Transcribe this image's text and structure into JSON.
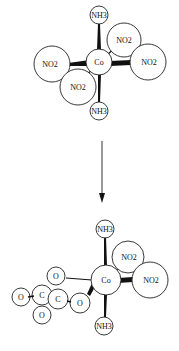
{
  "diagram": {
    "type": "reaction-scheme",
    "reactant": {
      "center": "Co",
      "ligands": {
        "axial_top": "NH3",
        "axial_bottom": "NH3",
        "no2_upper_right": "NO2",
        "no2_right": "NO2",
        "no2_left": "NO2",
        "no2_lower_left": "NO2"
      }
    },
    "arrow": {
      "direction": "down"
    },
    "product": {
      "center": "Co",
      "ligands": {
        "axial_top": "NH3",
        "axial_bottom": "NH3",
        "no2_upper_right": "NO2",
        "no2_right": "NO2"
      },
      "oxalate": {
        "o_top": "O",
        "o_far_left": "O",
        "c_left": "C",
        "c_right": "C",
        "o_right": "O",
        "o_bottom": "O"
      }
    }
  }
}
